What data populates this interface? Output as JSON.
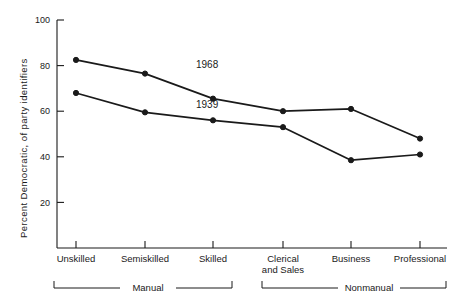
{
  "chart_data": {
    "type": "line",
    "title": "",
    "xlabel": "",
    "ylabel": "Percent Democratic, of party identifiers",
    "ylim": [
      0,
      100
    ],
    "yticks": [
      20,
      40,
      60,
      80,
      100
    ],
    "ytick_labels": [
      "20",
      "40",
      "60",
      "80",
      "100"
    ],
    "grid": false,
    "legend_position": "inline-annotations",
    "categories": [
      "Unskilled",
      "Semiskilled",
      "Skilled",
      "Clerical and Sales",
      "Business",
      "Professional"
    ],
    "category_labels": [
      {
        "line1": "Unskilled",
        "line2": ""
      },
      {
        "line1": "Semiskilled",
        "line2": ""
      },
      {
        "line1": "Skilled",
        "line2": ""
      },
      {
        "line1": "Clerical",
        "line2": "and  Sales"
      },
      {
        "line1": "Business",
        "line2": ""
      },
      {
        "line1": "Professional",
        "line2": ""
      }
    ],
    "series": [
      {
        "name": "1968",
        "values": [
          82.5,
          76.5,
          65.5,
          60.0,
          61.0,
          48.0
        ]
      },
      {
        "name": "1939",
        "values": [
          68.0,
          59.5,
          56.0,
          53.0,
          38.5,
          41.0
        ]
      }
    ],
    "annotations": [
      {
        "text": "1968",
        "category_index": 2,
        "note": "label above upper line"
      },
      {
        "text": "1939",
        "category_index": 2,
        "note": "label above lower line"
      }
    ],
    "groups": [
      {
        "label": "Manual",
        "categories": [
          "Unskilled",
          "Semiskilled",
          "Skilled"
        ]
      },
      {
        "label": "Nonmanual",
        "categories": [
          "Clerical and Sales",
          "Business",
          "Professional"
        ]
      }
    ],
    "colors": {
      "line": "#1a1a1a",
      "marker": "#1a1a1a",
      "background": "#ffffff"
    }
  }
}
